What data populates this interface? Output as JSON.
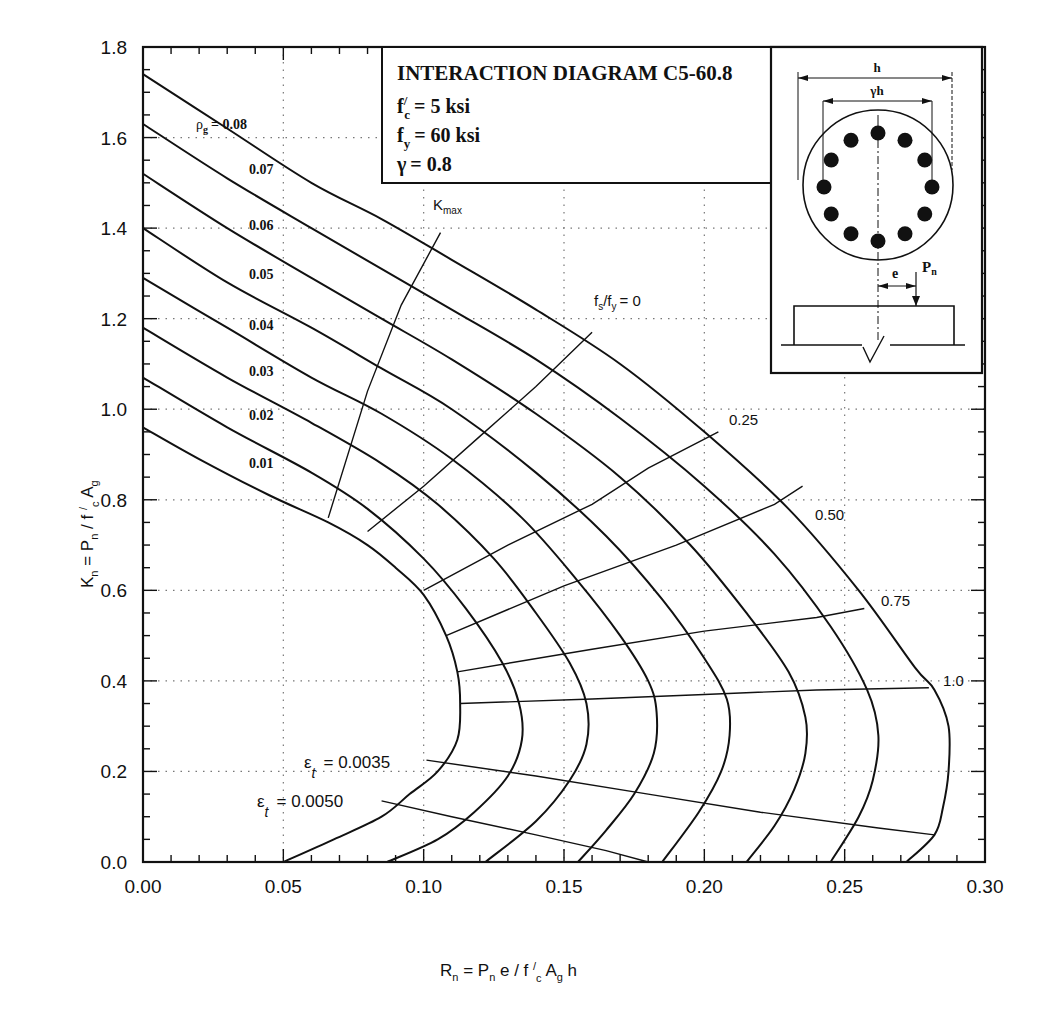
{
  "chart_data": {
    "type": "line",
    "title": "INTERACTION DIAGRAM C5-60.8",
    "parameters": [
      {
        "label": "f'c = 5 ksi",
        "symbol": "f",
        "sup": "/",
        "sub": "c",
        "value": "= 5 ksi"
      },
      {
        "label": "fy = 60 ksi",
        "symbol": "f",
        "sup": "",
        "sub": "y",
        "value": "= 60 ksi"
      },
      {
        "label": "γ = 0.8",
        "symbol": "γ",
        "sup": "",
        "sub": "",
        "value": "= 0.8"
      }
    ],
    "xlabel": "Rn = Pn e / f'c Ag h",
    "ylabel": "Kn = Pn / f'c Ag",
    "xlim": [
      0.0,
      0.3
    ],
    "ylim": [
      0.0,
      1.8
    ],
    "xticks": [
      "0.00",
      "0.05",
      "0.10",
      "0.15",
      "0.20",
      "0.25",
      "0.30"
    ],
    "yticks": [
      "0.0",
      "0.2",
      "0.4",
      "0.6",
      "0.8",
      "1.0",
      "1.2",
      "1.4",
      "1.6",
      "1.8"
    ],
    "grid": "dotted",
    "series": [
      {
        "name": "ρg = 0.08",
        "label": "0.08",
        "points": [
          [
            0.0,
            1.74
          ],
          [
            0.03,
            1.62
          ],
          [
            0.06,
            1.5
          ],
          [
            0.085,
            1.42
          ],
          [
            0.11,
            1.33
          ],
          [
            0.14,
            1.22
          ],
          [
            0.17,
            1.1
          ],
          [
            0.2,
            0.95
          ],
          [
            0.23,
            0.78
          ],
          [
            0.255,
            0.6
          ],
          [
            0.275,
            0.43
          ],
          [
            0.282,
            0.38
          ],
          [
            0.287,
            0.3
          ],
          [
            0.287,
            0.2
          ],
          [
            0.285,
            0.12
          ],
          [
            0.282,
            0.06
          ],
          [
            0.272,
            0.0
          ]
        ]
      },
      {
        "name": "ρg = 0.07",
        "label": "0.07",
        "points": [
          [
            0.0,
            1.63
          ],
          [
            0.03,
            1.51
          ],
          [
            0.06,
            1.4
          ],
          [
            0.085,
            1.31
          ],
          [
            0.11,
            1.22
          ],
          [
            0.14,
            1.11
          ],
          [
            0.17,
            0.98
          ],
          [
            0.2,
            0.83
          ],
          [
            0.225,
            0.68
          ],
          [
            0.245,
            0.52
          ],
          [
            0.258,
            0.38
          ],
          [
            0.262,
            0.28
          ],
          [
            0.26,
            0.18
          ],
          [
            0.255,
            0.1
          ],
          [
            0.245,
            0.0
          ]
        ]
      },
      {
        "name": "ρg = 0.06",
        "label": "0.06",
        "points": [
          [
            0.0,
            1.52
          ],
          [
            0.03,
            1.4
          ],
          [
            0.06,
            1.29
          ],
          [
            0.085,
            1.2
          ],
          [
            0.11,
            1.11
          ],
          [
            0.14,
            0.99
          ],
          [
            0.17,
            0.85
          ],
          [
            0.195,
            0.7
          ],
          [
            0.215,
            0.55
          ],
          [
            0.23,
            0.42
          ],
          [
            0.236,
            0.32
          ],
          [
            0.236,
            0.24
          ],
          [
            0.232,
            0.16
          ],
          [
            0.225,
            0.08
          ],
          [
            0.215,
            0.0
          ]
        ]
      },
      {
        "name": "ρg = 0.05",
        "label": "0.05",
        "points": [
          [
            0.0,
            1.4
          ],
          [
            0.03,
            1.28
          ],
          [
            0.06,
            1.18
          ],
          [
            0.085,
            1.09
          ],
          [
            0.11,
            1.0
          ],
          [
            0.14,
            0.86
          ],
          [
            0.165,
            0.72
          ],
          [
            0.185,
            0.58
          ],
          [
            0.2,
            0.45
          ],
          [
            0.208,
            0.36
          ],
          [
            0.209,
            0.28
          ],
          [
            0.206,
            0.2
          ],
          [
            0.198,
            0.11
          ],
          [
            0.185,
            0.0
          ]
        ]
      },
      {
        "name": "ρg = 0.04",
        "label": "0.04",
        "points": [
          [
            0.0,
            1.29
          ],
          [
            0.03,
            1.18
          ],
          [
            0.06,
            1.07
          ],
          [
            0.085,
            0.99
          ],
          [
            0.11,
            0.89
          ],
          [
            0.135,
            0.76
          ],
          [
            0.155,
            0.62
          ],
          [
            0.17,
            0.5
          ],
          [
            0.18,
            0.4
          ],
          [
            0.183,
            0.33
          ],
          [
            0.182,
            0.24
          ],
          [
            0.175,
            0.15
          ],
          [
            0.165,
            0.07
          ],
          [
            0.155,
            0.0
          ]
        ]
      },
      {
        "name": "ρg = 0.03",
        "label": "0.03",
        "points": [
          [
            0.0,
            1.18
          ],
          [
            0.03,
            1.07
          ],
          [
            0.06,
            0.97
          ],
          [
            0.085,
            0.88
          ],
          [
            0.105,
            0.79
          ],
          [
            0.125,
            0.67
          ],
          [
            0.14,
            0.55
          ],
          [
            0.152,
            0.44
          ],
          [
            0.158,
            0.35
          ],
          [
            0.158,
            0.26
          ],
          [
            0.152,
            0.18
          ],
          [
            0.14,
            0.09
          ],
          [
            0.122,
            0.0
          ]
        ]
      },
      {
        "name": "ρg = 0.02",
        "label": "0.02",
        "points": [
          [
            0.0,
            1.07
          ],
          [
            0.03,
            0.96
          ],
          [
            0.06,
            0.86
          ],
          [
            0.08,
            0.78
          ],
          [
            0.1,
            0.67
          ],
          [
            0.115,
            0.56
          ],
          [
            0.128,
            0.44
          ],
          [
            0.134,
            0.35
          ],
          [
            0.135,
            0.27
          ],
          [
            0.13,
            0.19
          ],
          [
            0.118,
            0.11
          ],
          [
            0.105,
            0.05
          ],
          [
            0.087,
            0.0
          ]
        ]
      },
      {
        "name": "ρg = 0.01",
        "label": "0.01",
        "points": [
          [
            0.0,
            0.96
          ],
          [
            0.02,
            0.89
          ],
          [
            0.045,
            0.81
          ],
          [
            0.066,
            0.75
          ],
          [
            0.08,
            0.7
          ],
          [
            0.09,
            0.65
          ],
          [
            0.1,
            0.59
          ],
          [
            0.108,
            0.5
          ],
          [
            0.112,
            0.42
          ],
          [
            0.113,
            0.35
          ],
          [
            0.112,
            0.27
          ],
          [
            0.105,
            0.2
          ],
          [
            0.095,
            0.15
          ],
          [
            0.085,
            0.1
          ],
          [
            0.068,
            0.05
          ],
          [
            0.05,
            0.0
          ]
        ]
      }
    ],
    "strain_lines": [
      {
        "name": "Kmax",
        "label": "K",
        "sub": "max",
        "points": [
          [
            0.066,
            0.76
          ],
          [
            0.08,
            1.04
          ],
          [
            0.092,
            1.23
          ],
          [
            0.106,
            1.39
          ]
        ]
      },
      {
        "name": "fs/fy = 0",
        "label": "fs/fy = 0",
        "points": [
          [
            0.08,
            0.73
          ],
          [
            0.1,
            0.83
          ],
          [
            0.12,
            0.94
          ],
          [
            0.14,
            1.05
          ],
          [
            0.16,
            1.17
          ]
        ]
      },
      {
        "name": "fs/fy = 0.25",
        "label": "0.25",
        "points": [
          [
            0.1,
            0.6
          ],
          [
            0.13,
            0.7
          ],
          [
            0.16,
            0.79
          ],
          [
            0.18,
            0.87
          ],
          [
            0.205,
            0.95
          ]
        ]
      },
      {
        "name": "fs/fy = 0.50",
        "label": "0.50",
        "points": [
          [
            0.108,
            0.5
          ],
          [
            0.15,
            0.61
          ],
          [
            0.19,
            0.7
          ],
          [
            0.225,
            0.79
          ],
          [
            0.235,
            0.83
          ]
        ]
      },
      {
        "name": "fs/fy = 0.75",
        "label": "0.75",
        "points": [
          [
            0.112,
            0.42
          ],
          [
            0.16,
            0.47
          ],
          [
            0.2,
            0.51
          ],
          [
            0.24,
            0.54
          ],
          [
            0.257,
            0.56
          ]
        ]
      },
      {
        "name": "fs/fy = 1.0",
        "label": "1.0",
        "points": [
          [
            0.113,
            0.35
          ],
          [
            0.16,
            0.36
          ],
          [
            0.2,
            0.37
          ],
          [
            0.24,
            0.38
          ],
          [
            0.28,
            0.385
          ]
        ]
      },
      {
        "name": "εt = 0.0035",
        "label": "ε",
        "sub": "t",
        "value": "= 0.0035",
        "points": [
          [
            0.101,
            0.225
          ],
          [
            0.14,
            0.19
          ],
          [
            0.18,
            0.15
          ],
          [
            0.22,
            0.11
          ],
          [
            0.262,
            0.075
          ],
          [
            0.282,
            0.06
          ]
        ]
      },
      {
        "name": "εt = 0.0050",
        "label": "ε",
        "sub": "t",
        "value": "= 0.0050",
        "points": [
          [
            0.085,
            0.135
          ],
          [
            0.11,
            0.1
          ],
          [
            0.14,
            0.06
          ],
          [
            0.165,
            0.025
          ],
          [
            0.18,
            0.0
          ]
        ]
      }
    ],
    "rho_label_prefix": "ρ",
    "rho_label_sub": "g",
    "rho_first_value": "= 0.08",
    "inset": {
      "h_label": "h",
      "gamma_h_label": "γh",
      "e_label": "e",
      "pn_label": "P",
      "pn_sub": "n",
      "bar_count": 12
    },
    "annotations": {
      "kmax": "Kmax",
      "fs_fy_prefix": "f",
      "fs_sub": "s",
      "fy_sub": "y",
      "fs_fy_value": "= 0",
      "eps_0035": "= 0.0035",
      "eps_0050": "= 0.0050"
    }
  }
}
